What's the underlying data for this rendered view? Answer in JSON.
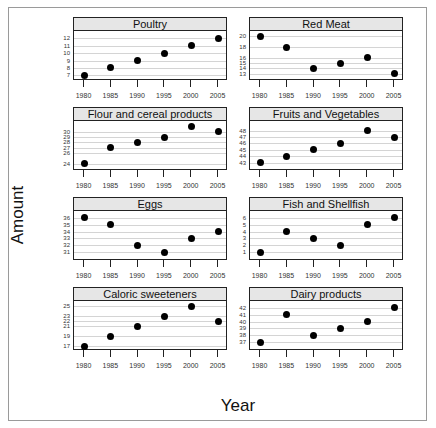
{
  "chart_data": {
    "type": "scatter",
    "title": "",
    "xlabel": "Year",
    "ylabel": "Amount",
    "layout": "lattice 2 columns x 4 rows, free y scales",
    "grid": true,
    "x": [
      1980,
      1985,
      1990,
      1995,
      2000,
      2005
    ],
    "x_tick_labels": [
      "1980",
      "1985",
      "1990",
      "1995",
      "2000",
      "2005"
    ],
    "panels": [
      {
        "name": "Poultry",
        "values": [
          7,
          8,
          9,
          10,
          11,
          12
        ],
        "yticks": [
          7,
          8,
          9,
          10,
          11,
          12
        ],
        "ylim": [
          6.5,
          13
        ]
      },
      {
        "name": "Red Meat",
        "values": [
          20,
          18,
          14,
          15,
          16,
          13
        ],
        "yticks": [
          13,
          14,
          15,
          16,
          18,
          20
        ],
        "ylim": [
          12,
          21
        ]
      },
      {
        "name": "Flour and cereal products",
        "values": [
          24,
          27,
          28,
          29,
          31,
          30
        ],
        "yticks": [
          24,
          26,
          27,
          28,
          29,
          30
        ],
        "ylim": [
          23,
          32
        ]
      },
      {
        "name": "Fruits and Vegetables",
        "values": [
          43,
          44,
          45,
          46,
          48,
          47
        ],
        "yticks": [
          43,
          44,
          45,
          46,
          47,
          48
        ],
        "ylim": [
          42,
          49.5
        ]
      },
      {
        "name": "Eggs",
        "values": [
          36,
          35,
          32,
          31,
          33,
          34
        ],
        "yticks": [
          31,
          32,
          33,
          34,
          35,
          36
        ],
        "ylim": [
          30,
          37
        ]
      },
      {
        "name": "Fish and Shellfish",
        "values": [
          1,
          4,
          3,
          2,
          5,
          6
        ],
        "yticks": [
          1,
          2,
          3,
          4,
          5,
          6
        ],
        "ylim": [
          0,
          7
        ]
      },
      {
        "name": "Caloric sweeteners",
        "values": [
          17,
          19,
          21,
          23,
          25,
          22
        ],
        "yticks": [
          17,
          19,
          21,
          22,
          23,
          25
        ],
        "ylim": [
          16.5,
          26
        ]
      },
      {
        "name": "Dairy products",
        "values": [
          37,
          41,
          38,
          39,
          40,
          42
        ],
        "yticks": [
          37,
          38,
          39,
          40,
          41,
          42
        ],
        "ylim": [
          36,
          43
        ]
      }
    ]
  }
}
